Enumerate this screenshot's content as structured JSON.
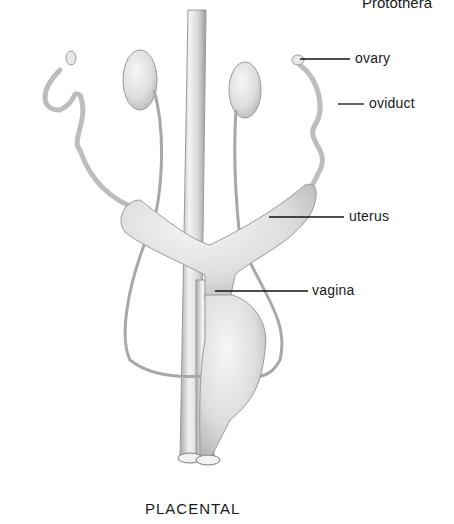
{
  "header": {
    "text": "Protothera"
  },
  "diagram": {
    "labels": [
      {
        "id": "ovary",
        "text": "ovary"
      },
      {
        "id": "oviduct",
        "text": "oviduct"
      },
      {
        "id": "uterus",
        "text": "uterus"
      },
      {
        "id": "vagina",
        "text": "vagina"
      }
    ],
    "caption": "PLACENTAL",
    "colors": {
      "organ_fill": "#e6e6e6",
      "organ_stroke": "#9a9a9a",
      "leader_line": "#111111",
      "text": "#1a1a1a"
    }
  }
}
